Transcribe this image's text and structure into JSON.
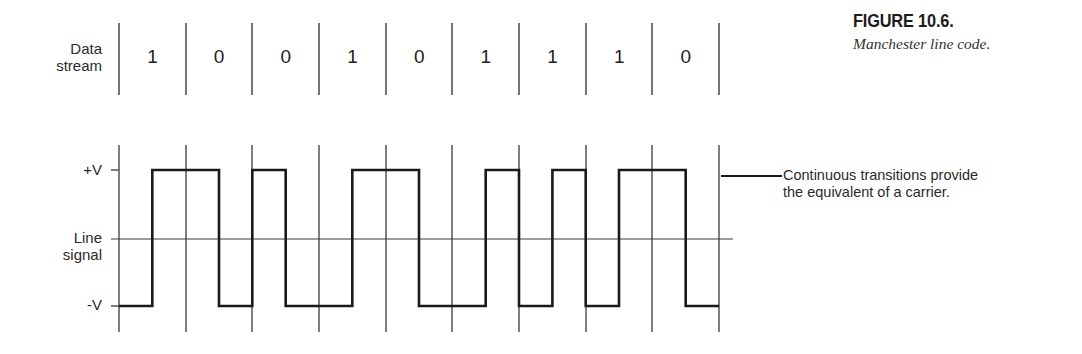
{
  "figure": {
    "number": "FIGURE 10.6.",
    "caption": "Manchester line code."
  },
  "data_stream": {
    "label_line1": "Data",
    "label_line2": "stream",
    "bits": [
      "1",
      "0",
      "0",
      "1",
      "0",
      "1",
      "1",
      "1",
      "0"
    ]
  },
  "line_signal": {
    "label_line1": "Line",
    "label_line2": "signal",
    "level_high": "+V",
    "level_low": "-V"
  },
  "callout": {
    "line1": "Continuous transitions provide",
    "line2": "the equivalent of a carrier."
  },
  "encoding": {
    "name": "Manchester",
    "rule": "1 = low-to-high transition at bit center; 0 = high-to-low transition at bit center"
  },
  "colors": {
    "ink": "#1a1a1a",
    "grid": "#3a3a3a",
    "background": "#ffffff"
  }
}
